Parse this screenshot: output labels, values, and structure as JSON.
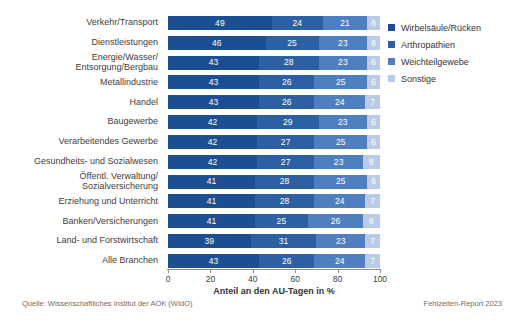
{
  "chart_data": {
    "type": "bar",
    "orientation": "horizontal",
    "stacked": true,
    "stack_mode": "percent",
    "title": "",
    "xlabel": "Anteil an den AU-Tagen in %",
    "ylabel": "",
    "xlim": [
      0,
      100
    ],
    "xticks": [
      0,
      20,
      40,
      60,
      80,
      100
    ],
    "grid": false,
    "legend_position": "right-top",
    "categories": [
      "Verkehr/Transport",
      "Dienstleistungen",
      "Energie/Wasser/\nEntsorgung/Bergbau",
      "Metallindustrie",
      "Handel",
      "Baugewerbe",
      "Verarbeitendes Gewerbe",
      "Gesundheits- und Sozialwesen",
      "Öffentl. Verwaltung/\nSozialversicherung",
      "Erziehung und Unterricht",
      "Banken/Versicherungen",
      "Land- und Forstwirtschaft",
      "Alle Branchen"
    ],
    "series": [
      {
        "name": "Wirbelsäule/Rücken",
        "color": "#1c4f91",
        "values": [
          49,
          46,
          43,
          43,
          43,
          42,
          42,
          42,
          41,
          41,
          41,
          39,
          43
        ]
      },
      {
        "name": "Arthropathien",
        "color": "#2d5fa3",
        "values": [
          24,
          25,
          28,
          26,
          26,
          29,
          27,
          27,
          28,
          28,
          25,
          31,
          26
        ]
      },
      {
        "name": "Weichteilgewebe",
        "color": "#4f7fc0",
        "values": [
          21,
          23,
          23,
          25,
          24,
          23,
          25,
          23,
          25,
          24,
          26,
          23,
          24
        ]
      },
      {
        "name": "Sonstige",
        "color": "#b9cbe6",
        "values": [
          6,
          6,
          6,
          6,
          7,
          6,
          6,
          8,
          6,
          7,
          8,
          7,
          7
        ]
      }
    ]
  },
  "legend": {
    "items": [
      {
        "label": "Wirbelsäule/Rücken"
      },
      {
        "label": "Arthropathien"
      },
      {
        "label": "Weichteilgewebe"
      },
      {
        "label": "Sonstige"
      }
    ]
  },
  "axis": {
    "x_title": "Anteil an den AU-Tagen in %",
    "ticks": [
      "0",
      "20",
      "40",
      "60",
      "80",
      "100"
    ]
  },
  "footer": {
    "source": "Quelle: Wissenschaftliches Institut der AOK (WIdO)",
    "report": "Fehlzeiten-Report 2023"
  }
}
